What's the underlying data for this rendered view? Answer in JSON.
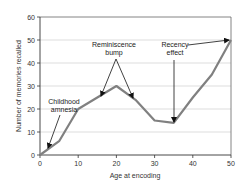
{
  "chart_data": {
    "type": "line",
    "title": "",
    "xlabel": "Age at encoding",
    "ylabel": "Number of memories recalled",
    "xlim": [
      0,
      50
    ],
    "ylim": [
      0,
      60
    ],
    "x_ticks": [
      0,
      10,
      20,
      30,
      40,
      50
    ],
    "y_ticks": [
      0,
      10,
      20,
      30,
      40,
      50,
      60
    ],
    "grid": "horizontal",
    "legend": "none",
    "series": [
      {
        "name": "Memories recalled",
        "color": "#808080",
        "x": [
          0,
          5,
          10,
          15,
          20,
          25,
          30,
          35,
          40,
          45,
          50
        ],
        "values": [
          0,
          6,
          20,
          25,
          30,
          24,
          15,
          14,
          25,
          35,
          50
        ]
      }
    ],
    "annotations": [
      {
        "id": "childhood",
        "line1": "Childhood",
        "line2": "amnesia",
        "points_to": [
          [
            2,
            2
          ]
        ]
      },
      {
        "id": "reminiscence",
        "line1": "Reminiscence",
        "line2": "bump",
        "points_to": [
          [
            15,
            25
          ],
          [
            25,
            24
          ]
        ]
      },
      {
        "id": "recency",
        "line1": "Recency",
        "line2": "effect",
        "points_to": [
          [
            35,
            14
          ],
          [
            50,
            50
          ]
        ]
      }
    ]
  },
  "labels": {
    "xlabel": "Age at encoding",
    "ylabel": "Number of memories recalled",
    "x_ticks": [
      "0",
      "10",
      "20",
      "30",
      "40",
      "50"
    ],
    "y_ticks": [
      "0",
      "10",
      "20",
      "30",
      "40",
      "50",
      "60"
    ],
    "childhood_1": "Childhood",
    "childhood_2": "amnesia",
    "reminiscence_1": "Reminiscence",
    "reminiscence_2": "bump",
    "recency_1": "Recency",
    "recency_2": "effect"
  }
}
